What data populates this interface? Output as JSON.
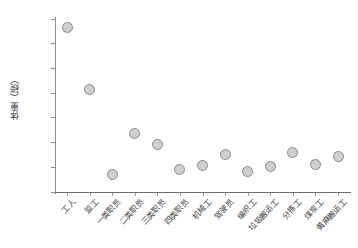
{
  "chart_data": {
    "type": "scatter",
    "title": "",
    "subtitle": "",
    "xlabel": "",
    "ylabel": "体重（磅）",
    "ylim": [
      100,
      170
    ],
    "ytick_step": 10,
    "yticks": [
      100,
      110,
      120,
      130,
      140,
      150,
      160,
      170
    ],
    "grid": false,
    "legend": false,
    "marker_fill": "#cfcfcf",
    "marker_edge": "#8a8a8a",
    "axis_color": "#8d8d8d",
    "categories": [
      "工人",
      "监工",
      "一类职员",
      "二类职员",
      "三类职员",
      "四类职员",
      "机械工",
      "驾驶员",
      "编织工",
      "垃圾搬运工",
      "分拣工",
      "煤炭工",
      "黄麻搬运工"
    ],
    "values": [
      166.5,
      141.3,
      107.2,
      123.5,
      119.3,
      109.2,
      110.9,
      115.0,
      108.1,
      110.4,
      116.0,
      111.3,
      114.5
    ],
    "series": [
      {
        "name": "体重",
        "values": [
          166.5,
          141.3,
          107.2,
          123.5,
          119.3,
          109.2,
          110.9,
          115.0,
          108.1,
          110.4,
          116.0,
          111.3,
          114.5
        ]
      }
    ]
  }
}
